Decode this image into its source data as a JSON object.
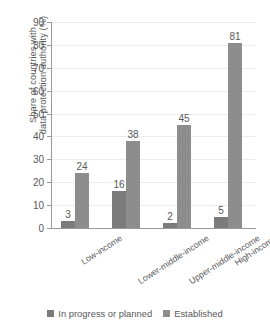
{
  "chart_data": {
    "type": "bar",
    "title": "",
    "xlabel": "",
    "ylabel": "Share of countries with data protection authority (%)",
    "ylabel_line1": "Share of countries with",
    "ylabel_line2": "data protection authority (%)",
    "ylim": [
      0,
      90
    ],
    "ytick_step": 10,
    "yticks": [
      0,
      10,
      20,
      30,
      40,
      50,
      60,
      70,
      80,
      90
    ],
    "ytick_labels": [
      "0",
      "10",
      "20",
      "30",
      "40",
      "50",
      "60",
      "70",
      "80",
      "90"
    ],
    "grid": true,
    "grid_axis": "y",
    "legend_position": "bottom",
    "categories": [
      "Low-income",
      "Lower-middle-income",
      "Upper-middle-income",
      "High-income"
    ],
    "series": [
      {
        "name": "In progress or planned",
        "color": "#7b7b7b",
        "values": [
          3,
          16,
          2,
          5
        ],
        "value_labels": [
          "3",
          "16",
          "2",
          "5"
        ]
      },
      {
        "name": "Established",
        "color": "#8d8d8d",
        "values": [
          24,
          38,
          45,
          81
        ],
        "value_labels": [
          "24",
          "38",
          "45",
          "81"
        ]
      }
    ]
  },
  "legend": {
    "items": [
      {
        "label": "In progress or planned",
        "color": "#7b7b7b"
      },
      {
        "label": "Established",
        "color": "#8d8d8d"
      }
    ]
  },
  "colors": {
    "background": "#ffffff",
    "text": "#58585a",
    "axis": "#9a9a9a",
    "gridline": "#ececec",
    "series_in_progress": "#7b7b7b",
    "series_established": "#8d8d8d"
  }
}
